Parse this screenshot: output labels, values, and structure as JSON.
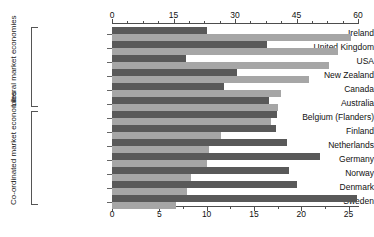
{
  "chart_data": {
    "type": "bar",
    "orientation": "horizontal",
    "title": "",
    "xlabel": "",
    "ylabel": "",
    "grid": false,
    "legend": "none",
    "series": [
      {
        "name": "dark-series",
        "color": "#595959"
      },
      {
        "name": "light-series",
        "color": "#a6a6a6"
      }
    ],
    "groups": [
      {
        "name": "Liberal market economies",
        "axis": "top",
        "axis_range": [
          0,
          60
        ],
        "axis_ticks": [
          0,
          15,
          30,
          45,
          60
        ],
        "axis_tick_labels": [
          "0",
          "15",
          "30",
          "45",
          "60"
        ],
        "axis_minor_step": 3.75,
        "categories": [
          "Ireland",
          "United Kingdom",
          "USA",
          "New Zealand",
          "Canada",
          "Australia"
        ],
        "dark_values": [
          23.2,
          37.8,
          18.0,
          30.5,
          27.2,
          38.4
        ],
        "light_values": [
          58.4,
          55.2,
          53.0,
          48.0,
          41.2,
          40.5
        ]
      },
      {
        "name": "Co-ordinated market economies",
        "axis": "bottom",
        "axis_range": [
          0,
          26
        ],
        "axis_ticks": [
          0,
          5,
          10,
          15,
          20,
          25
        ],
        "axis_tick_labels": [
          "0",
          "5",
          "10",
          "15",
          "20",
          "25"
        ],
        "axis_minor_step": 2.5,
        "categories": [
          "Belgium (Flanders)",
          "Finland",
          "Netherlands",
          "Germany",
          "Norway",
          "Denmark",
          "Sweden"
        ],
        "dark_values": [
          17.4,
          17.3,
          18.5,
          22.0,
          18.7,
          19.6,
          25.9
        ],
        "light_values": [
          16.8,
          11.5,
          10.3,
          10.0,
          8.3,
          7.9,
          6.8
        ]
      }
    ]
  },
  "axes": {
    "top": {
      "labels": [
        "0",
        "15",
        "30",
        "45",
        "60"
      ]
    },
    "bottom": {
      "labels": [
        "0",
        "5",
        "10",
        "15",
        "20",
        "25"
      ]
    }
  },
  "group_labels": {
    "liberal": "Liberal market\neconomies",
    "liberal_line1": "Liberal market",
    "liberal_line2": "economies",
    "coordinated_line1": "Co-ordinated market",
    "coordinated_line2": "economies"
  },
  "categories": {
    "ireland": "Ireland",
    "united_kingdom": "United Kingdom",
    "usa": "USA",
    "new_zealand": "New Zealand",
    "canada": "Canada",
    "australia": "Australia",
    "belgium": "Belgium (Flanders)",
    "finland": "Finland",
    "netherlands": "Netherlands",
    "germany": "Germany",
    "norway": "Norway",
    "denmark": "Denmark",
    "sweden": "Sweden"
  },
  "colors": {
    "dark_bar": "#595959",
    "light_bar": "#a6a6a6",
    "axis": "#4d4d4d",
    "text": "#111111",
    "background": "#ffffff"
  }
}
